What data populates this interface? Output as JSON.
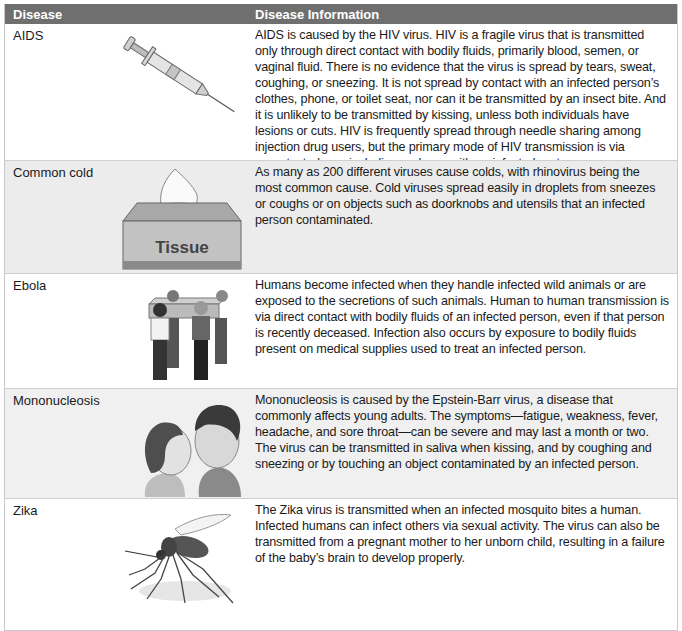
{
  "table": {
    "headers": [
      "Disease",
      "Disease Information"
    ],
    "rows": [
      {
        "disease": "AIDS",
        "image": "syringe-image",
        "info": "AIDS is caused by the HIV virus. HIV is a fragile virus that is transmitted only through direct contact with bodily fluids, primarily blood, semen, or vaginal fluid. There is no evidence that the virus is spread by tears, sweat, coughing, or sneezing. It is not spread by contact with an infected person’s clothes, phone, or toilet seat, nor can it be transmitted by an insect bite. And it is unlikely to be transmitted by kissing, unless both individuals have lesions or cuts. HIV is frequently spread through needle sharing among injection drug users, but the primary mode of HIV transmission is via unprotected sex, including oral sex, with an infected partner."
      },
      {
        "disease": "Common cold",
        "image": "tissue-box-image",
        "image_label": "Tissue",
        "info": "As many as 200 different viruses cause colds, with rhinovirus being the most common cause. Cold viruses spread easily in droplets from sneezes or coughs or on objects such as doorknobs and utensils that an infected person contaminated."
      },
      {
        "disease": "Ebola",
        "image": "people-carrying-coffin-image",
        "info": "Humans become infected when they handle infected wild animals or are exposed to the secretions of such animals. Human to human transmission is via direct contact with bodily fluids of an infected person, even if that person is recently deceased. Infection also occurs by exposure to bodily fluids present on medical supplies used to treat an infected person."
      },
      {
        "disease": "Mononucleosis",
        "image": "couple-kissing-image",
        "info": "Mononucleosis is caused by the Epstein-Barr virus, a disease that commonly affects young adults. The symptoms—fatigue, weakness, fever, headache, and sore throat—can be severe and may last a month or two. The virus can be transmitted in saliva when kissing, and by coughing and sneezing or by touching an object contaminated by an infected person."
      },
      {
        "disease": "Zika",
        "image": "mosquito-image",
        "info": "The Zika virus is transmitted when an infected mosquito bites a human. Infected humans can infect others via sexual activity. The virus can also be transmitted from a pregnant mother to her unborn child, resulting in a failure of the baby’s brain to develop properly."
      }
    ]
  },
  "colors": {
    "header_bg": "#6f6f6f",
    "header_text": "#ffffff",
    "shaded_row": "#ececec",
    "white_row": "#ffffff"
  }
}
